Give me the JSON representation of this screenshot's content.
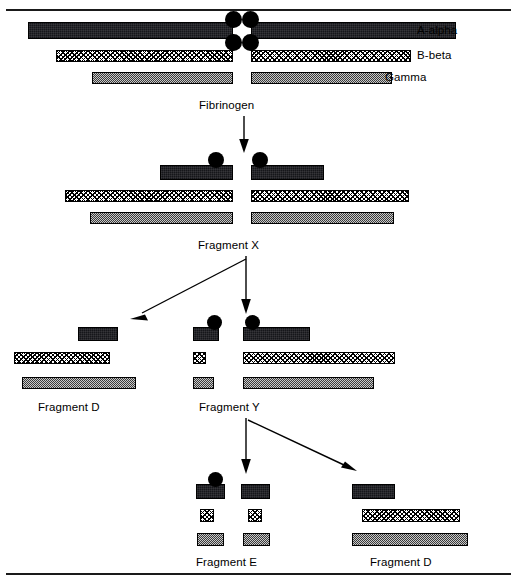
{
  "figure": {
    "background": "#ffffff",
    "width": 517,
    "height": 582
  },
  "legend": {
    "items": [
      {
        "label": "A-alpha",
        "pattern": "solid-black",
        "color": "#15161a"
      },
      {
        "label": "B-beta",
        "pattern": "cross-hatch",
        "color": "#000000"
      },
      {
        "label": "Gamma",
        "pattern": "checkerboard",
        "color": "#9a9a9a"
      }
    ]
  },
  "stages": {
    "fibrinogen": {
      "label": "Fibrinogen"
    },
    "fragment_x": {
      "label": "Fragment X"
    },
    "fragment_d_left": {
      "label": "Fragment D"
    },
    "fragment_y": {
      "label": "Fragment Y"
    },
    "fragment_e": {
      "label": "Fragment E"
    },
    "fragment_d_bottom": {
      "label": "Fragment D"
    }
  },
  "colors": {
    "ink": "#000000",
    "aalpha": "#15161a",
    "gamma": "#9a9a9a",
    "paper": "#ffffff"
  }
}
